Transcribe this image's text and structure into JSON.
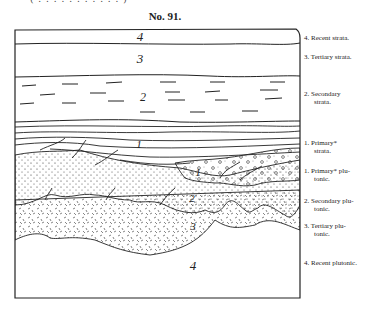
{
  "header": {
    "clipped_top_text": "( . . . . . . . . . . . )",
    "figure_number": "No. 91."
  },
  "diagram": {
    "type": "geological-section",
    "layers": [
      {
        "number": "4",
        "name": "Recent strata",
        "pattern": "plain"
      },
      {
        "number": "3",
        "name": "Tertiary strata",
        "pattern": "plain"
      },
      {
        "number": "2",
        "name": "Secondary strata",
        "pattern": "dashes"
      },
      {
        "number": "1",
        "name": "Primary* strata",
        "pattern": "wavy-lines"
      },
      {
        "number": "1",
        "name": "Primary* plutonic",
        "pattern": "circles"
      },
      {
        "number": "2",
        "name": "Secondary plutonic",
        "pattern": "dots"
      },
      {
        "number": "3",
        "name": "Tertiary plutonic",
        "pattern": "hatch"
      },
      {
        "number": "4",
        "name": "Recent plutonic",
        "pattern": "plain"
      }
    ],
    "in_figure_numbers": {
      "recent_strata": "4",
      "tertiary_strata": "3",
      "secondary_strata": "2",
      "primary_strata": "1",
      "primary_plutonic": "1",
      "secondary_plutonic": "2",
      "tertiary_plutonic": "3",
      "recent_plutonic": "4"
    }
  },
  "legend": [
    {
      "line1": "4. Recent strata.",
      "line2": ""
    },
    {
      "line1": "3. Tertiary strata.",
      "line2": ""
    },
    {
      "line1": "2. Secondary",
      "line2": "strata."
    },
    {
      "line1": "1. Primary*",
      "line2": "strata."
    },
    {
      "line1": "1. Primary* plu-",
      "line2": "tonic."
    },
    {
      "line1": "2. Secondary plu-",
      "line2": "tonic."
    },
    {
      "line1": "3. Tertiary plu-",
      "line2": "tonic."
    },
    {
      "line1": "4. Recent plutonic.",
      "line2": ""
    }
  ]
}
